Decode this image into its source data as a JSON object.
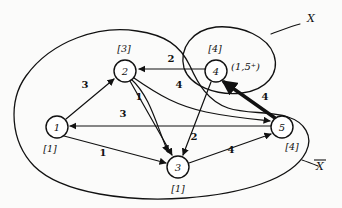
{
  "figure": {
    "background_color": "#fbfbfa",
    "ink_color": "#111111"
  },
  "nodes": [
    {
      "id": "1",
      "name": "node-1",
      "label": "[1]",
      "cx": 57,
      "cy": 127,
      "r": 11,
      "label_x": 50,
      "label_y": 152
    },
    {
      "id": "2",
      "name": "node-2",
      "label": "[3]",
      "cx": 125,
      "cy": 71,
      "r": 11,
      "label_x": 124,
      "label_y": 52
    },
    {
      "id": "3",
      "name": "node-3",
      "label": "[1]",
      "cx": 178,
      "cy": 167,
      "r": 11,
      "label_x": 178,
      "label_y": 192
    },
    {
      "id": "4",
      "name": "node-4",
      "label": "[4]",
      "cx": 216,
      "cy": 71,
      "r": 11,
      "label_x": 215,
      "label_y": 52
    },
    {
      "id": "5",
      "name": "node-5",
      "label": "[4]",
      "cx": 282,
      "cy": 127,
      "r": 11,
      "label_x": 292,
      "label_y": 150
    }
  ],
  "edges": [
    {
      "name": "edge-4-to-2",
      "from": "4",
      "to": "2",
      "weight": "2",
      "label_x": 171,
      "label_y": 62,
      "highlighted": false
    },
    {
      "name": "edge-1-to-2",
      "from": "1",
      "to": "2",
      "weight": "3",
      "label_x": 85,
      "label_y": 88,
      "highlighted": false
    },
    {
      "name": "edge-2-to-3",
      "from": "2",
      "to": "3",
      "weight": "1",
      "label_x": 139,
      "label_y": 100,
      "highlighted": false
    },
    {
      "name": "edge-5-to-1",
      "from": "5",
      "to": "1",
      "weight": "3",
      "label_x": 123,
      "label_y": 117,
      "highlighted": false
    },
    {
      "name": "edge-1-to-3",
      "from": "1",
      "to": "3",
      "weight": "1",
      "label_x": 103,
      "label_y": 156,
      "highlighted": false
    },
    {
      "name": "edge-2-to-5",
      "from": "2",
      "to": "5",
      "weight": "4",
      "label_x": 179,
      "label_y": 88,
      "highlighted": false
    },
    {
      "name": "edge-4-to-3",
      "from": "4",
      "to": "3",
      "weight": "2",
      "label_x": 194,
      "label_y": 140,
      "highlighted": false
    },
    {
      "name": "edge-3-to-5",
      "from": "3",
      "to": "5",
      "weight": "4",
      "label_x": 231,
      "label_y": 153,
      "highlighted": false
    },
    {
      "name": "edge-5-to-4",
      "from": "5",
      "to": "4",
      "weight": "4",
      "label_x": 265,
      "label_y": 100,
      "highlighted": true
    }
  ],
  "annotations": [
    {
      "name": "node-4-flow-annotation",
      "text": "(1,5⁺)",
      "x": 231,
      "y": 70
    }
  ],
  "regions": [
    {
      "name": "region-x",
      "label": "X",
      "label_x": 311,
      "label_y": 22,
      "overbar": false
    },
    {
      "name": "region-x-bar",
      "label": "X",
      "label_x": 320,
      "label_y": 170,
      "overbar": true
    }
  ]
}
